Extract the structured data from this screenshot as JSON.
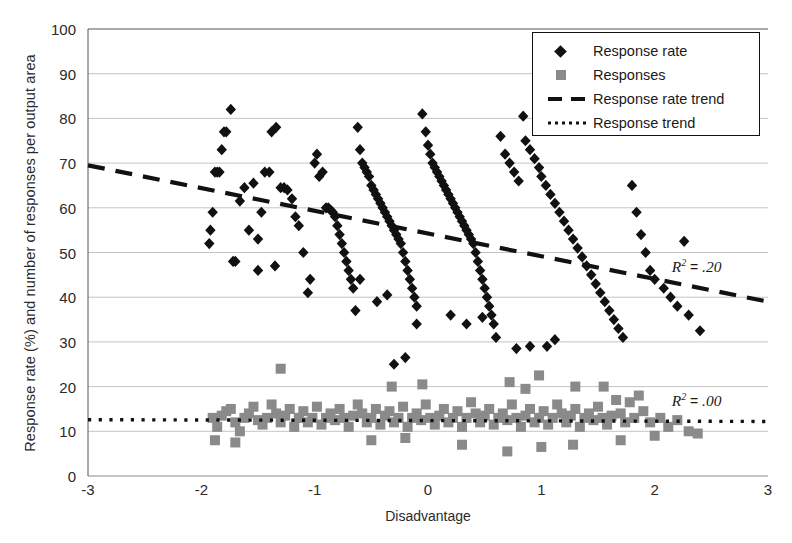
{
  "chart_data": {
    "type": "scatter",
    "title": "",
    "xlabel": "Disadvantage",
    "ylabel": "Response rate (%) and number of responses per output area",
    "xlim": [
      -3,
      3
    ],
    "ylim": [
      0,
      100
    ],
    "xticks": [
      "-3",
      "-2",
      "-1",
      "0",
      "1",
      "2",
      "3"
    ],
    "xtick_values": [
      -3,
      -2,
      -1,
      0,
      1,
      2,
      3
    ],
    "yticks": [
      "0",
      "10",
      "20",
      "30",
      "40",
      "50",
      "60",
      "70",
      "80",
      "90",
      "100"
    ],
    "ytick_values": [
      0,
      10,
      20,
      30,
      40,
      50,
      60,
      70,
      80,
      90,
      100
    ],
    "grid": true,
    "legend_position": "top-right",
    "legend": [
      {
        "label": "Response rate",
        "marker": "diamond",
        "color": "#111111"
      },
      {
        "label": "Responses",
        "marker": "square",
        "color": "#8a8a8a"
      },
      {
        "label": "Response rate trend",
        "marker": "dashed-line",
        "color": "#111111"
      },
      {
        "label": "Response trend",
        "marker": "dotted-line",
        "color": "#111111"
      }
    ],
    "annotations": [
      {
        "name": "r2-response-rate",
        "text": "R2 = .20",
        "r2": ".20",
        "x": 2.15,
        "y": 46.5
      },
      {
        "name": "r2-responses",
        "text": "R2 = .00",
        "r2": ".00",
        "x": 2.15,
        "y": 16.5
      }
    ],
    "trendlines": [
      {
        "name": "Response rate trend",
        "style": "dashed",
        "color": "#111111",
        "x": [
          -3,
          3
        ],
        "y": [
          69.5,
          39.0
        ],
        "r2": 0.2
      },
      {
        "name": "Response trend",
        "style": "dotted",
        "color": "#111111",
        "x": [
          -3,
          3
        ],
        "y": [
          12.6,
          12.2
        ],
        "r2": 0.0
      }
    ],
    "series": [
      {
        "name": "Response rate",
        "marker": "diamond",
        "color": "#111111",
        "points": [
          [
            -1.93,
            52.0
          ],
          [
            -1.92,
            55.0
          ],
          [
            -1.9,
            59.0
          ],
          [
            -1.88,
            68.0
          ],
          [
            -1.86,
            68.0
          ],
          [
            -1.84,
            68.0
          ],
          [
            -1.82,
            73.0
          ],
          [
            -1.8,
            77.0
          ],
          [
            -1.78,
            77.0
          ],
          [
            -1.74,
            82.0
          ],
          [
            -1.72,
            48.0
          ],
          [
            -1.7,
            48.0
          ],
          [
            -1.66,
            61.5
          ],
          [
            -1.62,
            64.5
          ],
          [
            -1.58,
            55.0
          ],
          [
            -1.54,
            65.5
          ],
          [
            -1.5,
            53.0
          ],
          [
            -1.47,
            59.0
          ],
          [
            -1.44,
            68.0
          ],
          [
            -1.4,
            68.0
          ],
          [
            -1.38,
            77.0
          ],
          [
            -1.34,
            78.0
          ],
          [
            -1.3,
            64.5
          ],
          [
            -1.27,
            64.5
          ],
          [
            -1.24,
            64.0
          ],
          [
            -1.2,
            62.0
          ],
          [
            -1.17,
            58.0
          ],
          [
            -1.14,
            56.0
          ],
          [
            -1.1,
            50.0
          ],
          [
            -1.06,
            41.0
          ],
          [
            -1.04,
            44.0
          ],
          [
            -1.0,
            70.0
          ],
          [
            -0.98,
            72.0
          ],
          [
            -0.96,
            67.0
          ],
          [
            -0.93,
            68.0
          ],
          [
            -0.9,
            60.0
          ],
          [
            -0.88,
            60.0
          ],
          [
            -0.86,
            59.5
          ],
          [
            -0.84,
            59.0
          ],
          [
            -0.82,
            58.0
          ],
          [
            -0.8,
            56.0
          ],
          [
            -0.78,
            54.0
          ],
          [
            -0.76,
            52.0
          ],
          [
            -0.74,
            50.0
          ],
          [
            -0.72,
            48.0
          ],
          [
            -0.7,
            46.0
          ],
          [
            -0.68,
            44.0
          ],
          [
            -0.66,
            42.0
          ],
          [
            -0.64,
            37.0
          ],
          [
            -0.62,
            78.0
          ],
          [
            -0.6,
            73.0
          ],
          [
            -0.58,
            70.0
          ],
          [
            -0.56,
            69.0
          ],
          [
            -0.54,
            68.0
          ],
          [
            -0.52,
            67.0
          ],
          [
            -0.5,
            65.0
          ],
          [
            -0.48,
            64.0
          ],
          [
            -0.46,
            63.0
          ],
          [
            -0.44,
            62.0
          ],
          [
            -0.42,
            61.0
          ],
          [
            -0.4,
            60.0
          ],
          [
            -0.38,
            59.0
          ],
          [
            -0.36,
            58.0
          ],
          [
            -0.34,
            57.0
          ],
          [
            -0.32,
            56.0
          ],
          [
            -0.3,
            55.0
          ],
          [
            -0.28,
            54.0
          ],
          [
            -0.26,
            53.0
          ],
          [
            -0.24,
            52.0
          ],
          [
            -0.22,
            50.0
          ],
          [
            -0.2,
            48.0
          ],
          [
            -0.18,
            46.0
          ],
          [
            -0.16,
            44.0
          ],
          [
            -0.14,
            42.0
          ],
          [
            -0.12,
            40.0
          ],
          [
            -0.1,
            38.0
          ],
          [
            -0.3,
            25.0
          ],
          [
            -0.05,
            81.0
          ],
          [
            -0.02,
            77.0
          ],
          [
            0.0,
            74.0
          ],
          [
            0.02,
            72.0
          ],
          [
            0.04,
            70.0
          ],
          [
            0.06,
            69.0
          ],
          [
            0.08,
            68.0
          ],
          [
            0.1,
            67.0
          ],
          [
            0.12,
            66.0
          ],
          [
            0.14,
            65.0
          ],
          [
            0.16,
            64.0
          ],
          [
            0.18,
            63.0
          ],
          [
            0.2,
            62.0
          ],
          [
            0.22,
            61.0
          ],
          [
            0.24,
            60.0
          ],
          [
            0.26,
            59.0
          ],
          [
            0.28,
            58.0
          ],
          [
            0.3,
            57.0
          ],
          [
            0.32,
            56.0
          ],
          [
            0.34,
            55.0
          ],
          [
            0.36,
            54.0
          ],
          [
            0.38,
            53.0
          ],
          [
            0.4,
            52.0
          ],
          [
            0.42,
            50.0
          ],
          [
            0.44,
            48.0
          ],
          [
            0.46,
            46.0
          ],
          [
            0.48,
            44.0
          ],
          [
            0.5,
            42.0
          ],
          [
            0.52,
            40.0
          ],
          [
            0.54,
            38.0
          ],
          [
            0.56,
            36.0
          ],
          [
            0.58,
            34.0
          ],
          [
            0.6,
            31.0
          ],
          [
            0.64,
            76.0
          ],
          [
            0.68,
            72.0
          ],
          [
            0.72,
            70.0
          ],
          [
            0.76,
            68.0
          ],
          [
            0.8,
            66.0
          ],
          [
            0.84,
            80.5
          ],
          [
            0.86,
            75.0
          ],
          [
            0.9,
            73.0
          ],
          [
            0.94,
            71.0
          ],
          [
            0.98,
            69.0
          ],
          [
            1.0,
            67.0
          ],
          [
            1.04,
            65.0
          ],
          [
            1.08,
            63.0
          ],
          [
            1.12,
            61.0
          ],
          [
            1.16,
            59.0
          ],
          [
            1.2,
            57.0
          ],
          [
            1.24,
            55.0
          ],
          [
            1.28,
            53.0
          ],
          [
            1.32,
            51.0
          ],
          [
            1.36,
            49.0
          ],
          [
            1.4,
            47.0
          ],
          [
            1.44,
            45.0
          ],
          [
            1.48,
            43.0
          ],
          [
            1.52,
            41.0
          ],
          [
            1.56,
            39.0
          ],
          [
            1.6,
            37.0
          ],
          [
            1.64,
            35.0
          ],
          [
            1.68,
            33.0
          ],
          [
            1.72,
            31.0
          ],
          [
            1.8,
            65.0
          ],
          [
            1.84,
            59.0
          ],
          [
            1.88,
            54.0
          ],
          [
            1.92,
            50.0
          ],
          [
            1.96,
            46.0
          ],
          [
            2.0,
            44.0
          ],
          [
            2.08,
            42.0
          ],
          [
            2.14,
            40.0
          ],
          [
            2.2,
            38.0
          ],
          [
            2.26,
            52.5
          ],
          [
            2.3,
            36.0
          ],
          [
            2.4,
            32.5
          ],
          [
            0.78,
            28.5
          ],
          [
            0.9,
            29.0
          ],
          [
            1.05,
            29.0
          ],
          [
            1.12,
            30.5
          ],
          [
            0.34,
            34.0
          ],
          [
            0.48,
            35.5
          ],
          [
            0.2,
            36.0
          ],
          [
            -0.1,
            34.0
          ],
          [
            -0.6,
            44.0
          ],
          [
            -0.36,
            40.5
          ],
          [
            -0.45,
            39.0
          ],
          [
            -1.5,
            46.0
          ],
          [
            -1.35,
            47.0
          ],
          [
            -0.2,
            26.5
          ]
        ]
      },
      {
        "name": "Responses",
        "marker": "square",
        "color": "#8a8a8a",
        "points": [
          [
            -1.9,
            13.0
          ],
          [
            -1.86,
            11.0
          ],
          [
            -1.82,
            13.5
          ],
          [
            -1.78,
            14.5
          ],
          [
            -1.74,
            15.0
          ],
          [
            -1.7,
            12.0
          ],
          [
            -1.66,
            10.0
          ],
          [
            -1.62,
            13.0
          ],
          [
            -1.58,
            14.0
          ],
          [
            -1.54,
            15.5
          ],
          [
            -1.5,
            12.5
          ],
          [
            -1.46,
            11.5
          ],
          [
            -1.42,
            13.0
          ],
          [
            -1.38,
            16.0
          ],
          [
            -1.34,
            14.0
          ],
          [
            -1.3,
            12.0
          ],
          [
            -1.26,
            13.5
          ],
          [
            -1.22,
            15.0
          ],
          [
            -1.18,
            11.0
          ],
          [
            -1.14,
            13.0
          ],
          [
            -1.1,
            14.5
          ],
          [
            -1.06,
            12.0
          ],
          [
            -1.02,
            13.0
          ],
          [
            -0.98,
            15.5
          ],
          [
            -0.94,
            11.5
          ],
          [
            -0.9,
            13.0
          ],
          [
            -0.86,
            14.0
          ],
          [
            -0.82,
            12.5
          ],
          [
            -0.78,
            15.0
          ],
          [
            -0.74,
            13.0
          ],
          [
            -0.7,
            11.0
          ],
          [
            -0.66,
            13.5
          ],
          [
            -0.62,
            16.0
          ],
          [
            -0.58,
            14.0
          ],
          [
            -0.54,
            12.0
          ],
          [
            -0.5,
            13.0
          ],
          [
            -0.46,
            15.0
          ],
          [
            -0.42,
            11.5
          ],
          [
            -0.38,
            13.5
          ],
          [
            -0.34,
            14.5
          ],
          [
            -0.3,
            12.0
          ],
          [
            -0.26,
            13.0
          ],
          [
            -0.22,
            15.5
          ],
          [
            -0.18,
            11.0
          ],
          [
            -0.14,
            13.0
          ],
          [
            -0.1,
            14.0
          ],
          [
            -0.06,
            12.5
          ],
          [
            -0.02,
            16.0
          ],
          [
            0.02,
            13.0
          ],
          [
            0.06,
            11.5
          ],
          [
            0.1,
            13.5
          ],
          [
            0.14,
            15.0
          ],
          [
            0.18,
            12.0
          ],
          [
            0.22,
            13.0
          ],
          [
            0.26,
            14.5
          ],
          [
            0.3,
            11.0
          ],
          [
            0.34,
            13.0
          ],
          [
            0.38,
            16.5
          ],
          [
            0.42,
            14.0
          ],
          [
            0.46,
            12.0
          ],
          [
            0.5,
            13.5
          ],
          [
            0.54,
            15.0
          ],
          [
            0.58,
            11.5
          ],
          [
            0.62,
            13.0
          ],
          [
            0.66,
            14.0
          ],
          [
            0.7,
            12.5
          ],
          [
            0.74,
            16.0
          ],
          [
            0.78,
            13.0
          ],
          [
            0.82,
            11.0
          ],
          [
            0.86,
            13.5
          ],
          [
            0.9,
            15.0
          ],
          [
            0.94,
            12.0
          ],
          [
            0.98,
            13.0
          ],
          [
            1.02,
            14.5
          ],
          [
            1.06,
            11.5
          ],
          [
            1.1,
            13.0
          ],
          [
            1.14,
            16.0
          ],
          [
            1.18,
            14.0
          ],
          [
            1.22,
            12.0
          ],
          [
            1.26,
            13.5
          ],
          [
            1.3,
            15.0
          ],
          [
            1.34,
            11.0
          ],
          [
            1.38,
            13.0
          ],
          [
            1.42,
            14.0
          ],
          [
            1.46,
            12.5
          ],
          [
            1.5,
            15.5
          ],
          [
            1.54,
            13.0
          ],
          [
            1.58,
            11.5
          ],
          [
            1.62,
            13.5
          ],
          [
            1.66,
            17.0
          ],
          [
            1.7,
            14.0
          ],
          [
            1.74,
            12.0
          ],
          [
            1.78,
            16.5
          ],
          [
            1.82,
            13.0
          ],
          [
            1.86,
            18.0
          ],
          [
            1.9,
            14.5
          ],
          [
            1.96,
            12.0
          ],
          [
            2.05,
            13.0
          ],
          [
            2.12,
            11.0
          ],
          [
            2.2,
            12.5
          ],
          [
            2.3,
            10.0
          ],
          [
            2.38,
            9.5
          ],
          [
            -0.32,
            20.0
          ],
          [
            -0.05,
            20.5
          ],
          [
            0.72,
            21.0
          ],
          [
            0.98,
            22.5
          ],
          [
            1.3,
            20.0
          ],
          [
            1.55,
            20.0
          ],
          [
            -1.3,
            24.0
          ],
          [
            0.86,
            19.5
          ],
          [
            -1.88,
            8.0
          ],
          [
            -1.7,
            7.5
          ],
          [
            0.3,
            7.0
          ],
          [
            0.7,
            5.5
          ],
          [
            1.0,
            6.5
          ],
          [
            1.28,
            7.0
          ],
          [
            -0.5,
            8.0
          ],
          [
            -0.2,
            8.5
          ],
          [
            1.7,
            8.0
          ],
          [
            2.0,
            9.0
          ]
        ]
      }
    ]
  },
  "axis": {
    "ylabel": "Response rate (%) and number of responses per output area",
    "xlabel": "Disadvantage"
  }
}
